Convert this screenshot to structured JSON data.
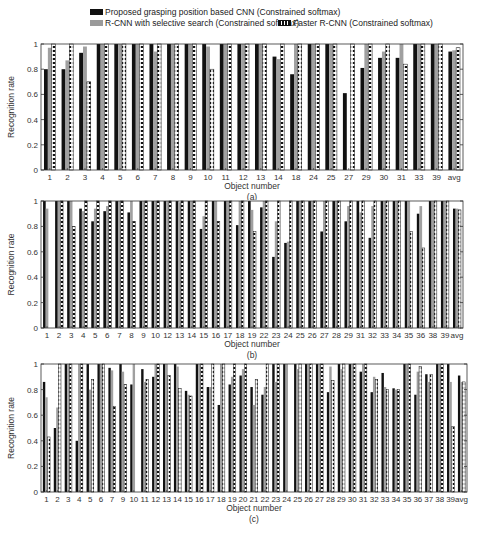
{
  "legend": {
    "items": [
      {
        "label": "Proposed grasping position based CNN (Constrained softmax)",
        "style": "black"
      },
      {
        "label": "R-CNN with selective search (Constrained softmax)",
        "style": "gray"
      },
      {
        "label": "Faster R-CNN (Constrained softmax)",
        "style": "striped"
      }
    ]
  },
  "chart_data": [
    {
      "type": "bar",
      "panel": "(a)",
      "xlabel": "Object number",
      "ylabel": "Recognition rate",
      "ylim": [
        0,
        1
      ],
      "yticks": [
        "0",
        "0.2",
        "0.4",
        "0.6",
        "0.8",
        "1"
      ],
      "categories": [
        "1",
        "2",
        "3",
        "4",
        "5",
        "6",
        "7",
        "8",
        "9",
        "10",
        "11",
        "12",
        "13",
        "14",
        "18",
        "24",
        "25",
        "27",
        "29",
        "30",
        "31",
        "33",
        "39",
        "avg"
      ],
      "series": [
        {
          "name": "Proposed grasping position based CNN (Constrained softmax)",
          "values": [
            0.8,
            0.8,
            0.93,
            1,
            1,
            1,
            1,
            1,
            1,
            1,
            1,
            1,
            1,
            0.9,
            0.76,
            1,
            1,
            0.61,
            0.81,
            0.89,
            0.89,
            1,
            1,
            0.94
          ]
        },
        {
          "name": "R-CNN with selective search (Constrained softmax)",
          "values": [
            0.97,
            0.87,
            0.98,
            1,
            1,
            1,
            0.94,
            1,
            1,
            0.98,
            1,
            1,
            1,
            0.88,
            1,
            1,
            1,
            0,
            1,
            0.94,
            1,
            1,
            1,
            0.95
          ]
        },
        {
          "name": "Faster R-CNN (Constrained softmax)",
          "values": [
            1,
            1,
            0.7,
            1,
            1,
            1,
            1,
            1,
            1,
            0.8,
            1,
            1,
            1,
            1,
            1,
            1,
            1,
            1,
            1,
            1,
            0.84,
            1,
            1,
            0.97
          ]
        }
      ]
    },
    {
      "type": "bar",
      "panel": "(b)",
      "xlabel": "Object number",
      "ylabel": "Recognition rate",
      "ylim": [
        0,
        1
      ],
      "yticks": [
        "0",
        "0.2",
        "0.4",
        "0.6",
        "0.8",
        "1"
      ],
      "categories": [
        "1",
        "2",
        "3",
        "4",
        "5",
        "6",
        "7",
        "8",
        "9",
        "10",
        "12",
        "13",
        "14",
        "15",
        "16",
        "17",
        "18",
        "19",
        "22",
        "23",
        "24",
        "25",
        "26",
        "27",
        "28",
        "29",
        "31",
        "32",
        "33",
        "34",
        "35",
        "36",
        "38",
        "39",
        "avg"
      ],
      "series": [
        {
          "name": "Proposed grasping position based CNN (Constrained softmax)",
          "values": [
            1,
            1,
            1,
            0.94,
            0.84,
            0.92,
            1,
            0.91,
            1,
            1,
            1,
            1,
            1,
            0.78,
            1,
            1,
            0.81,
            1,
            0.95,
            0.56,
            0.67,
            1,
            1,
            0.76,
            1,
            0.84,
            1,
            0.71,
            1,
            1,
            1,
            0.9,
            1,
            1,
            0.94
          ]
        },
        {
          "name": "R-CNN with selective search (Constrained softmax)",
          "values": [
            0.94,
            1,
            1,
            0.92,
            0.94,
            0.96,
            1,
            1,
            1,
            1,
            1,
            0.99,
            1,
            0.88,
            1,
            1,
            1,
            0.93,
            1,
            0.84,
            0.68,
            1,
            1,
            1,
            1,
            0.96,
            0.91,
            0.96,
            1,
            1,
            1,
            0.96,
            1,
            1,
            0.94
          ]
        },
        {
          "name": "Faster R-CNN (Constrained softmax)",
          "values": [
            0,
            1,
            0.8,
            1,
            1,
            1,
            1,
            0.84,
            1,
            1,
            1,
            1,
            1,
            1,
            0.84,
            1,
            1,
            0.76,
            1,
            1,
            1,
            1,
            1,
            1,
            1,
            1,
            1,
            1,
            1,
            1,
            0.76,
            0.63,
            1,
            1,
            0.93
          ]
        }
      ]
    },
    {
      "type": "bar",
      "panel": "(c)",
      "xlabel": "Object number",
      "ylabel": "Recognition rate",
      "ylim": [
        0,
        1
      ],
      "yticks": [
        "0",
        "0.2",
        "0.4",
        "0.6",
        "0.8",
        "1"
      ],
      "categories": [
        "1",
        "2",
        "3",
        "4",
        "5",
        "6",
        "7",
        "9",
        "10",
        "11",
        "12",
        "13",
        "14",
        "15",
        "16",
        "17",
        "18",
        "19",
        "20",
        "21",
        "22",
        "23",
        "24",
        "25",
        "26",
        "27",
        "28",
        "29",
        "30",
        "31",
        "32",
        "33",
        "34",
        "35",
        "36",
        "37",
        "38",
        "39",
        "avg"
      ],
      "series": [
        {
          "name": "Proposed grasping position based CNN (Constrained softmax)",
          "values": [
            0.86,
            0.5,
            1,
            0.4,
            1,
            1,
            0.97,
            1,
            0.84,
            0.96,
            0.9,
            1,
            1,
            0.79,
            1,
            0.82,
            0.68,
            0.84,
            0.91,
            0.82,
            0.76,
            1,
            1,
            1,
            1,
            1,
            0.78,
            1,
            1,
            0.94,
            0.78,
            0.93,
            0.81,
            1,
            0.76,
            0.92,
            1,
            1,
            0.91
          ]
        },
        {
          "name": "R-CNN with selective search (Constrained softmax)",
          "values": [
            0.74,
            0.66,
            1,
            1,
            0.8,
            1,
            0.95,
            0.94,
            1,
            0.86,
            1,
            1,
            0.98,
            0.76,
            1,
            0.82,
            1,
            0.9,
            0.96,
            0.68,
            0.82,
            0.86,
            1,
            0.96,
            1,
            1,
            0.98,
            0.96,
            1,
            1,
            0.9,
            0.82,
            0.8,
            1,
            0.94,
            0.86,
            1,
            0.86,
            0.86
          ]
        },
        {
          "name": "Faster R-CNN (Constrained softmax)",
          "values": [
            0.43,
            1,
            1,
            1,
            0.88,
            1,
            0.67,
            0.84,
            0,
            0.88,
            1,
            0.91,
            0.81,
            0.75,
            1,
            1,
            1,
            1,
            1,
            0.88,
            1,
            1,
            0,
            1,
            1,
            1,
            0.87,
            1,
            1,
            1,
            0.88,
            0.8,
            0.8,
            1,
            0.98,
            0.92,
            1,
            0.51,
            0.86
          ]
        }
      ]
    }
  ]
}
